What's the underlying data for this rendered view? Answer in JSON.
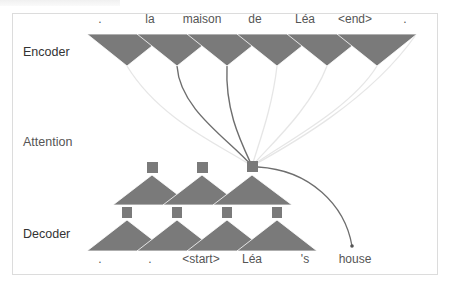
{
  "diagram": {
    "labels": {
      "encoder": "Encoder",
      "attention": "Attention",
      "decoder": "Decoder"
    },
    "encoder_tokens": [
      ".",
      "la",
      "maison",
      "de",
      "Léa",
      "<end>",
      "."
    ],
    "decoder_tokens": [
      ".",
      ".",
      "<start>",
      "Léa",
      "'s",
      "house"
    ],
    "colors": {
      "node_fill": "#7a7a7a",
      "strong_attention": "#6e6e6e",
      "weak_attention": "#e4e4e4",
      "text": "#333333",
      "frame_border": "#dcdcdc"
    }
  }
}
